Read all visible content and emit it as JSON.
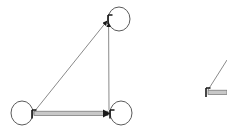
{
  "canvas": {
    "width": 227,
    "height": 136,
    "background": "#ffffff"
  },
  "palette": {
    "node_stroke": "#555555",
    "edge_thin_stroke": "#8a8a8a",
    "edge_thick_fill": "#c8c8c8",
    "edge_thick_stroke": "#6e6e6e",
    "arrowhead": "#1a1a1a",
    "loop_stroke": "#5a5a5a"
  },
  "diagram": {
    "type": "directed-graph",
    "title": "",
    "graphs": [
      {
        "id": "graph-main",
        "label": "",
        "nodes": [
          {
            "id": "n-top",
            "label": "",
            "x": 108,
            "y": 18,
            "loop": true,
            "loop_cx": 119,
            "loop_cy": 19,
            "loop_rx": 11,
            "loop_ry": 12
          },
          {
            "id": "n-bottom-left",
            "label": "",
            "x": 32,
            "y": 114,
            "loop": true,
            "loop_cx": 22,
            "loop_cy": 113,
            "loop_rx": 11,
            "loop_ry": 12
          },
          {
            "id": "n-bottom-right",
            "label": "",
            "x": 110,
            "y": 114,
            "loop": true,
            "loop_cx": 121,
            "loop_cy": 113,
            "loop_rx": 11,
            "loop_ry": 12
          }
        ],
        "edges": [
          {
            "id": "e-bl-to-top",
            "from": "n-bottom-left",
            "to": "n-top",
            "style": "thin",
            "arrow": "target"
          },
          {
            "id": "e-br-to-top",
            "from": "n-bottom-right",
            "to": "n-top",
            "style": "thin",
            "arrow": "target"
          },
          {
            "id": "e-bl-to-br",
            "from": "n-bottom-left",
            "to": "n-bottom-right",
            "style": "thick",
            "arrow": "target"
          }
        ]
      },
      {
        "id": "graph-partial-right",
        "label": "",
        "cropped": true,
        "nodes": [
          {
            "id": "p-corner",
            "label": "",
            "x": 206,
            "y": 92,
            "loop": false
          }
        ],
        "edges": [
          {
            "id": "p-diagonal",
            "from": "p-corner",
            "to": "off-canvas-up-right",
            "style": "thin",
            "arrow": "source"
          },
          {
            "id": "p-horizontal",
            "from": "p-corner",
            "to": "off-canvas-right",
            "style": "thick",
            "arrow": "source"
          }
        ]
      }
    ]
  }
}
